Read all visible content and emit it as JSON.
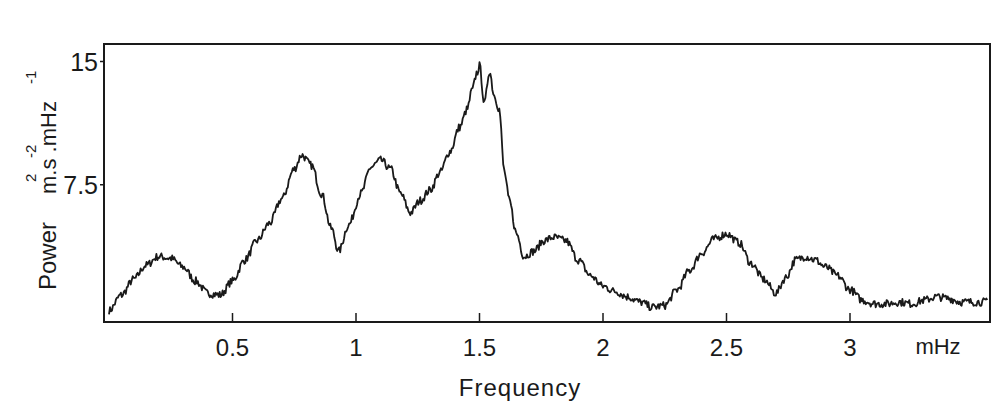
{
  "chart_data": {
    "type": "line",
    "title": "",
    "xlabel": "Frequency",
    "x_unit": "mHz",
    "ylabel": "Power",
    "y_unit": "m².s⁻².mHz⁻¹",
    "xlim": [
      -0.02,
      3.57
    ],
    "ylim": [
      0,
      15
    ],
    "x_ticks": [
      0.5,
      1,
      1.5,
      2,
      2.5,
      3
    ],
    "x_tick_labels": [
      "0.5",
      "1",
      "1.5",
      "2",
      "2.5",
      "3"
    ],
    "y_ticks": [
      7.5,
      15
    ],
    "y_tick_labels": [
      "7.5",
      "15"
    ],
    "grid": false,
    "legend": null,
    "series": [
      {
        "name": "Power spectrum",
        "x": [
          0.0,
          0.05,
          0.1,
          0.15,
          0.2,
          0.25,
          0.3,
          0.35,
          0.4,
          0.45,
          0.5,
          0.55,
          0.6,
          0.65,
          0.7,
          0.75,
          0.78,
          0.82,
          0.86,
          0.9,
          0.93,
          0.97,
          1.02,
          1.06,
          1.1,
          1.14,
          1.18,
          1.22,
          1.26,
          1.3,
          1.34,
          1.38,
          1.42,
          1.45,
          1.47,
          1.49,
          1.5,
          1.52,
          1.54,
          1.56,
          1.58,
          1.6,
          1.62,
          1.65,
          1.68,
          1.72,
          1.76,
          1.8,
          1.85,
          1.9,
          1.95,
          2.0,
          2.05,
          2.1,
          2.15,
          2.2,
          2.25,
          2.3,
          2.35,
          2.4,
          2.45,
          2.5,
          2.55,
          2.6,
          2.65,
          2.7,
          2.74,
          2.78,
          2.82,
          2.86,
          2.9,
          2.95,
          3.0,
          3.05,
          3.1,
          3.15,
          3.2,
          3.25,
          3.3,
          3.35,
          3.4,
          3.45,
          3.5,
          3.56
        ],
        "values": [
          0.3,
          1.2,
          2.1,
          2.9,
          3.4,
          3.3,
          2.8,
          2.0,
          1.3,
          1.2,
          2.0,
          3.2,
          4.3,
          5.3,
          6.7,
          8.4,
          9.2,
          8.6,
          7.0,
          5.0,
          3.7,
          5.2,
          7.0,
          8.5,
          8.9,
          8.4,
          7.0,
          5.9,
          6.6,
          7.2,
          8.2,
          9.4,
          10.8,
          11.8,
          12.9,
          13.9,
          14.3,
          12.1,
          14.0,
          12.6,
          11.8,
          8.3,
          6.6,
          4.7,
          3.4,
          3.7,
          4.3,
          4.5,
          4.3,
          3.2,
          2.3,
          1.7,
          1.4,
          1.1,
          0.8,
          0.5,
          0.6,
          1.5,
          2.6,
          3.6,
          4.4,
          4.7,
          4.2,
          3.0,
          2.1,
          1.3,
          2.2,
          3.2,
          3.4,
          3.2,
          2.8,
          2.3,
          1.5,
          0.9,
          0.7,
          0.7,
          0.8,
          0.7,
          0.9,
          1.1,
          1.0,
          0.8,
          0.8,
          0.8
        ]
      }
    ],
    "annotations": [
      "mHz"
    ],
    "frame": "box"
  },
  "axes": {
    "x_axis_title": "Frequency",
    "x_unit_label": "mHz",
    "y_axis_title": "Power",
    "y_unit_label": "m.s",
    "y_unit_exp1": "2",
    "y_unit_exp2": "-2",
    "y_unit_mid": ".mHz",
    "y_unit_exp3": "-1"
  },
  "style": {
    "line_color": "#1a1a1a",
    "background": "#ffffff",
    "frame_color": "#1a1a1a"
  }
}
